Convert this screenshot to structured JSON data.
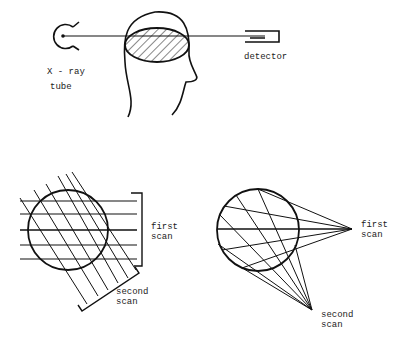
{
  "figure": {
    "top_panel": {
      "source_label_line1": "X - ray",
      "source_label_line2": "tube",
      "detector_label": "detector"
    },
    "bottom_left_panel": {
      "first_scan_line1": "first",
      "first_scan_line2": "scan",
      "second_scan_line1": "second",
      "second_scan_line2": "scan"
    },
    "bottom_right_panel": {
      "first_scan_line1": "first",
      "first_scan_line2": "scan",
      "second_scan_line1": "second",
      "second_scan_line2": "scan"
    }
  },
  "colors": {
    "ink": "#111111",
    "background": "#ffffff"
  }
}
